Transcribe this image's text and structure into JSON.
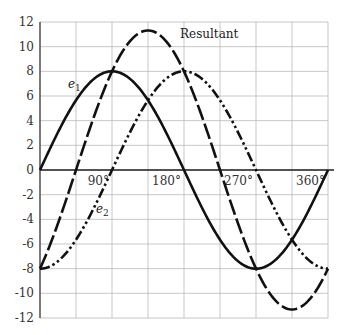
{
  "chart_data": {
    "type": "line",
    "title": "",
    "xlabel": "",
    "ylabel": "",
    "xlim": [
      0,
      360
    ],
    "ylim": [
      -12,
      12
    ],
    "grid": true,
    "legend_position": "inline labels",
    "x_tick_labels": [
      "90°",
      "180°",
      "270°",
      "360°"
    ],
    "x_ticks": [
      90,
      180,
      270,
      360
    ],
    "y_ticks": [
      12,
      10,
      8,
      6,
      4,
      2,
      0,
      -2,
      -4,
      -6,
      -8,
      -10,
      -12
    ],
    "y_tick_labels": [
      "12",
      "10",
      "8",
      "6",
      "4",
      "2",
      "0",
      "-2",
      "-4",
      "-6",
      "-8",
      "-10",
      "-12"
    ],
    "series": [
      {
        "name": "e1",
        "label": "e",
        "subscript": "1",
        "style": "solid",
        "amplitude": 8,
        "phase_deg": 0,
        "formula": "8 sin(θ)",
        "x": [
          0,
          45,
          90,
          135,
          180,
          225,
          270,
          315,
          360
        ],
        "values": [
          0,
          5.66,
          8,
          5.66,
          0,
          -5.66,
          -8,
          -5.66,
          0
        ]
      },
      {
        "name": "e2",
        "label": "e",
        "subscript": "2",
        "style": "dash-dot-dot",
        "amplitude": 8,
        "phase_deg": -90,
        "formula": "8 sin(θ - 90°)",
        "x": [
          0,
          45,
          90,
          135,
          180,
          225,
          270,
          315,
          360
        ],
        "values": [
          -8,
          -5.66,
          0,
          5.66,
          8,
          5.66,
          0,
          -5.66,
          -8
        ]
      },
      {
        "name": "Resultant",
        "label": "Resultant",
        "style": "long-dash",
        "amplitude": 11.31,
        "phase_deg": -45,
        "formula": "11.31 sin(θ - 45°)",
        "x": [
          0,
          45,
          90,
          135,
          180,
          225,
          270,
          315,
          360
        ],
        "values": [
          -8,
          0,
          8,
          11.31,
          8,
          0,
          -8,
          -11.31,
          -8
        ]
      }
    ]
  },
  "labels": {
    "resultant": "Resultant",
    "e": "e",
    "e1_sub": "1",
    "e2_sub": "2"
  }
}
